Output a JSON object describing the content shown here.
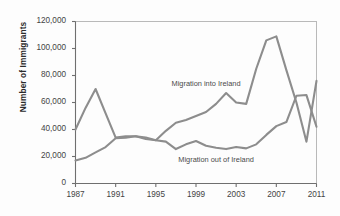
{
  "chart_data": {
    "type": "line",
    "title": "",
    "xlabel": "",
    "ylabel": "Number of Immigrants",
    "xlim": [
      1987,
      2011
    ],
    "ylim": [
      0,
      120000
    ],
    "grid": false,
    "legend_position": "inline-annotations",
    "line_color": "#8d8d8d",
    "axis_color": "#6f6f6f",
    "x": [
      1987,
      1988,
      1989,
      1990,
      1991,
      1992,
      1993,
      1994,
      1995,
      1996,
      1997,
      1998,
      1999,
      2000,
      2001,
      2002,
      2003,
      2004,
      2005,
      2006,
      2007,
      2008,
      2009,
      2010,
      2011
    ],
    "xticks": [
      "1987",
      "1991",
      "1995",
      "1999",
      "2003",
      "2007",
      "2011"
    ],
    "xtick_values": [
      1987,
      1991,
      1995,
      1999,
      2003,
      2007,
      2011
    ],
    "yticks": [
      "0",
      "20,000",
      "40,000",
      "60,000",
      "80,000",
      "100,000",
      "120,000"
    ],
    "ytick_values": [
      0,
      20000,
      40000,
      60000,
      80000,
      100000,
      120000
    ],
    "series": [
      {
        "name": "Migration into Ireland",
        "label": "Migration into Ireland",
        "label_x": 2000,
        "label_y": 74000,
        "values": [
          40000,
          56000,
          70000,
          52000,
          34000,
          35000,
          35000,
          33000,
          32000,
          39000,
          45000,
          47000,
          50000,
          53000,
          59000,
          67000,
          60000,
          59000,
          85000,
          106000,
          109000,
          84000,
          60000,
          31000,
          76000
        ]
      },
      {
        "name": "Migration out of Ireland",
        "label": "Migration out of Ireland",
        "label_x": 2001,
        "label_y": 17500,
        "values": [
          17000,
          19000,
          23000,
          27000,
          33500,
          34000,
          35000,
          34000,
          32000,
          31000,
          25500,
          29000,
          31500,
          28000,
          26500,
          25500,
          27000,
          26000,
          29000,
          36000,
          42500,
          45500,
          65000,
          65500,
          42000
        ]
      }
    ]
  }
}
